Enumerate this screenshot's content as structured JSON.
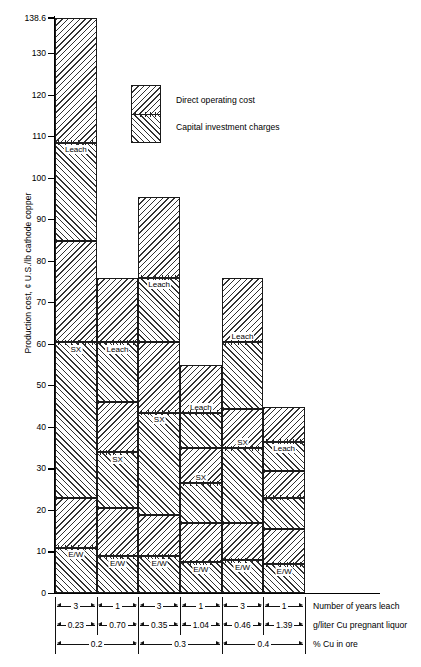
{
  "chart_data": {
    "type": "bar",
    "title": "",
    "ylabel": "Production cost, ¢ U.S./lb cathode copper",
    "xlabel": "",
    "ylim": [
      0,
      138.6
    ],
    "yticks": [
      0,
      10,
      20,
      30,
      40,
      50,
      60,
      70,
      80,
      90,
      100,
      110,
      120,
      130,
      138.6
    ],
    "ytick_labels": [
      "0",
      "10",
      "20",
      "30",
      "40",
      "50",
      "60",
      "70",
      "80",
      "90",
      "100",
      "110",
      "120",
      "130",
      "138.6"
    ],
    "grid": false,
    "stacked": true,
    "legend": [
      {
        "label": "Direct operating cost",
        "hatch": "\\\\"
      },
      {
        "label": "Capital investment charges",
        "hatch": "//"
      }
    ],
    "segment_names": [
      "E/W",
      "SX",
      "Leach"
    ],
    "categories": [
      "1",
      "2",
      "3",
      "4",
      "5",
      "6"
    ],
    "totals": [
      138.6,
      76.0,
      95.5,
      55.0,
      76.0,
      45.0
    ],
    "bars": [
      {
        "index": 1,
        "total": 138.6,
        "boundaries": [
          0,
          11,
          23,
          60.5,
          85,
          108.5,
          138.6
        ],
        "segments": [
          {
            "name": "E/W",
            "kind": "capital",
            "from": 0,
            "to": 11,
            "label": "E/W"
          },
          {
            "name": "E/W",
            "kind": "operating",
            "from": 11,
            "to": 23,
            "label": ""
          },
          {
            "name": "SX",
            "kind": "capital",
            "from": 23,
            "to": 60.5,
            "label": "SX"
          },
          {
            "name": "SX",
            "kind": "operating",
            "from": 60.5,
            "to": 85,
            "label": ""
          },
          {
            "name": "Leach",
            "kind": "capital",
            "from": 85,
            "to": 108.5,
            "label": "Leach"
          },
          {
            "name": "Leach",
            "kind": "operating",
            "from": 108.5,
            "to": 138.6,
            "label": ""
          }
        ]
      },
      {
        "index": 2,
        "total": 76.0,
        "boundaries": [
          0,
          9,
          20.5,
          34,
          46,
          60.5,
          76
        ],
        "segments": [
          {
            "name": "E/W",
            "kind": "capital",
            "from": 0,
            "to": 9,
            "label": "E/W"
          },
          {
            "name": "E/W",
            "kind": "operating",
            "from": 9,
            "to": 20.5,
            "label": ""
          },
          {
            "name": "SX",
            "kind": "capital",
            "from": 20.5,
            "to": 34,
            "label": "SX"
          },
          {
            "name": "SX",
            "kind": "operating",
            "from": 34,
            "to": 46,
            "label": ""
          },
          {
            "name": "Leach",
            "kind": "capital",
            "from": 46,
            "to": 60.5,
            "label": "Leach"
          },
          {
            "name": "Leach",
            "kind": "operating",
            "from": 60.5,
            "to": 76,
            "label": ""
          }
        ]
      },
      {
        "index": 3,
        "total": 95.5,
        "boundaries": [
          0,
          9,
          19,
          43.5,
          60.5,
          76,
          95.5
        ],
        "segments": [
          {
            "name": "E/W",
            "kind": "capital",
            "from": 0,
            "to": 9,
            "label": "E/W"
          },
          {
            "name": "E/W",
            "kind": "operating",
            "from": 9,
            "to": 19,
            "label": ""
          },
          {
            "name": "SX",
            "kind": "capital",
            "from": 19,
            "to": 43.5,
            "label": "SX"
          },
          {
            "name": "SX",
            "kind": "operating",
            "from": 43.5,
            "to": 60.5,
            "label": ""
          },
          {
            "name": "Leach",
            "kind": "capital",
            "from": 60.5,
            "to": 76,
            "label": "Leach"
          },
          {
            "name": "Leach",
            "kind": "operating",
            "from": 76,
            "to": 95.5,
            "label": ""
          }
        ]
      },
      {
        "index": 4,
        "total": 55.0,
        "boundaries": [
          0,
          7.5,
          17,
          26.5,
          35,
          43.5,
          55
        ],
        "segments": [
          {
            "name": "E/W",
            "kind": "capital",
            "from": 0,
            "to": 7.5,
            "label": "E/W"
          },
          {
            "name": "E/W",
            "kind": "operating",
            "from": 7.5,
            "to": 17,
            "label": ""
          },
          {
            "name": "SX",
            "kind": "capital",
            "from": 17,
            "to": 26.5,
            "label": ""
          },
          {
            "name": "SX",
            "kind": "operating",
            "from": 26.5,
            "to": 35,
            "label": "SX"
          },
          {
            "name": "Leach",
            "kind": "capital",
            "from": 35,
            "to": 43.5,
            "label": ""
          },
          {
            "name": "Leach",
            "kind": "operating",
            "from": 43.5,
            "to": 55,
            "label": "Leach"
          }
        ]
      },
      {
        "index": 5,
        "total": 76.0,
        "boundaries": [
          0,
          8,
          17,
          35,
          44.5,
          60.5,
          76
        ],
        "segments": [
          {
            "name": "E/W",
            "kind": "capital",
            "from": 0,
            "to": 8,
            "label": "E/W"
          },
          {
            "name": "E/W",
            "kind": "operating",
            "from": 8,
            "to": 17,
            "label": ""
          },
          {
            "name": "SX",
            "kind": "capital",
            "from": 17,
            "to": 35,
            "label": ""
          },
          {
            "name": "SX",
            "kind": "operating",
            "from": 35,
            "to": 44.5,
            "label": "SX"
          },
          {
            "name": "Leach",
            "kind": "capital",
            "from": 44.5,
            "to": 60.5,
            "label": ""
          },
          {
            "name": "Leach",
            "kind": "operating",
            "from": 60.5,
            "to": 76,
            "label": "Leach"
          }
        ]
      },
      {
        "index": 6,
        "total": 45.0,
        "boundaries": [
          0,
          7,
          15.5,
          23,
          29.5,
          36.5,
          45
        ],
        "segments": [
          {
            "name": "E/W",
            "kind": "capital",
            "from": 0,
            "to": 7,
            "label": "E/W"
          },
          {
            "name": "E/W",
            "kind": "operating",
            "from": 7,
            "to": 15.5,
            "label": ""
          },
          {
            "name": "SX",
            "kind": "capital",
            "from": 15.5,
            "to": 23,
            "label": ""
          },
          {
            "name": "SX",
            "kind": "operating",
            "from": 23,
            "to": 29.5,
            "label": ""
          },
          {
            "name": "Leach",
            "kind": "capital",
            "from": 29.5,
            "to": 36.5,
            "label": "Leach"
          },
          {
            "name": "Leach",
            "kind": "operating",
            "from": 36.5,
            "to": 45,
            "label": ""
          }
        ]
      }
    ],
    "bottom_table": {
      "rows": [
        {
          "label": "Number of years leach",
          "values": [
            "3",
            "1",
            "3",
            "1",
            "3",
            "1"
          ],
          "spans": [
            1,
            1,
            1,
            1,
            1,
            1
          ]
        },
        {
          "label": "g/liter Cu pregnant liquor",
          "values": [
            "0.23",
            "0.70",
            "0.35",
            "1.04",
            "0.46",
            "1.39"
          ],
          "spans": [
            1,
            1,
            1,
            1,
            1,
            1
          ]
        },
        {
          "label": "% Cu in ore",
          "values": [
            "0.2",
            "0.3",
            "0.4"
          ],
          "spans": [
            2,
            2,
            2
          ]
        }
      ]
    }
  }
}
